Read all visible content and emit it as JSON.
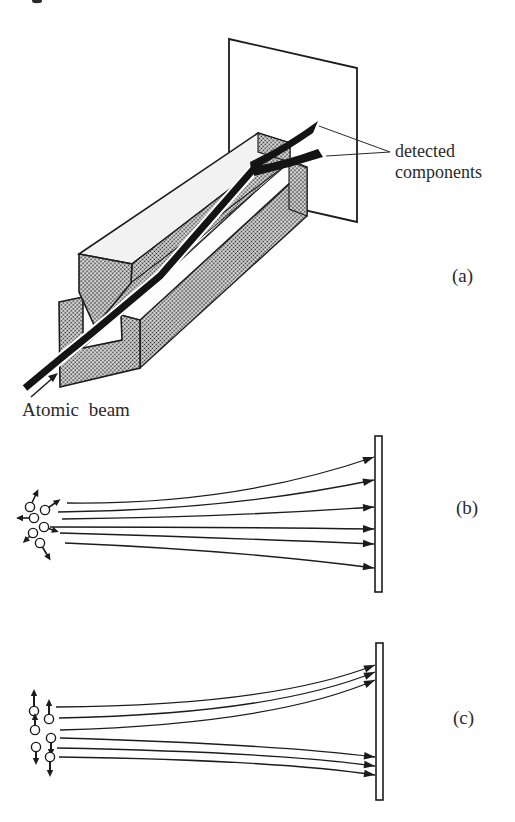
{
  "figure": {
    "ink_color": "#1c1c1c",
    "background": "#ffffff",
    "panels": [
      {
        "label": "(a)",
        "annotations": {
          "detected_line1": "detected",
          "detected_line2": "components",
          "beam_label": "Atomic beam"
        },
        "content": "magnet with knife-edge upper pole, grooved lower pole, beam split onto screen"
      },
      {
        "label": "(b)",
        "trajectory_count": 6,
        "atom_count": 6,
        "spin_arrows": "random directions"
      },
      {
        "label": "(c)",
        "trajectory_count": 6,
        "atom_count": 6,
        "spin_arrows": "up and down only"
      }
    ]
  }
}
